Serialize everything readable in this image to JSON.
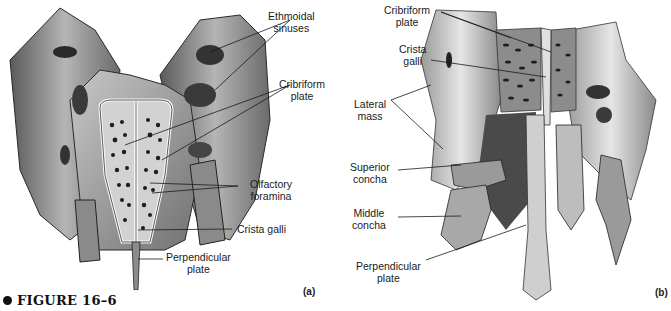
{
  "figure": {
    "caption_label": "FIGURE 16–6"
  },
  "panel_a": {
    "tag": "(a)",
    "labels": {
      "ethmoidal_sinuses_1": "Ethmoidal",
      "ethmoidal_sinuses_2": "sinuses",
      "cribriform_plate_1": "Cribriform",
      "cribriform_plate_2": "plate",
      "olfactory_foramina_1": "Olfactory",
      "olfactory_foramina_2": "foramina",
      "crista_galli": "Crista galli",
      "perpendicular_plate_1": "Perpendicular",
      "perpendicular_plate_2": "plate"
    }
  },
  "panel_b": {
    "tag": "(b)",
    "labels": {
      "cribriform_plate_1": "Cribriform",
      "cribriform_plate_2": "plate",
      "crista_galli_1": "Crista",
      "crista_galli_2": "galli",
      "lateral_mass_1": "Lateral",
      "lateral_mass_2": "mass",
      "superior_concha_1": "Superior",
      "superior_concha_2": "concha",
      "middle_concha_1": "Middle",
      "middle_concha_2": "concha",
      "perpendicular_plate_1": "Perpendicular",
      "perpendicular_plate_2": "plate"
    }
  },
  "colors": {
    "bone_light": "#e8e8e8",
    "bone_mid": "#a8a8a8",
    "bone_dark": "#4a4a4a",
    "leader_line": "#1a1a1a"
  }
}
